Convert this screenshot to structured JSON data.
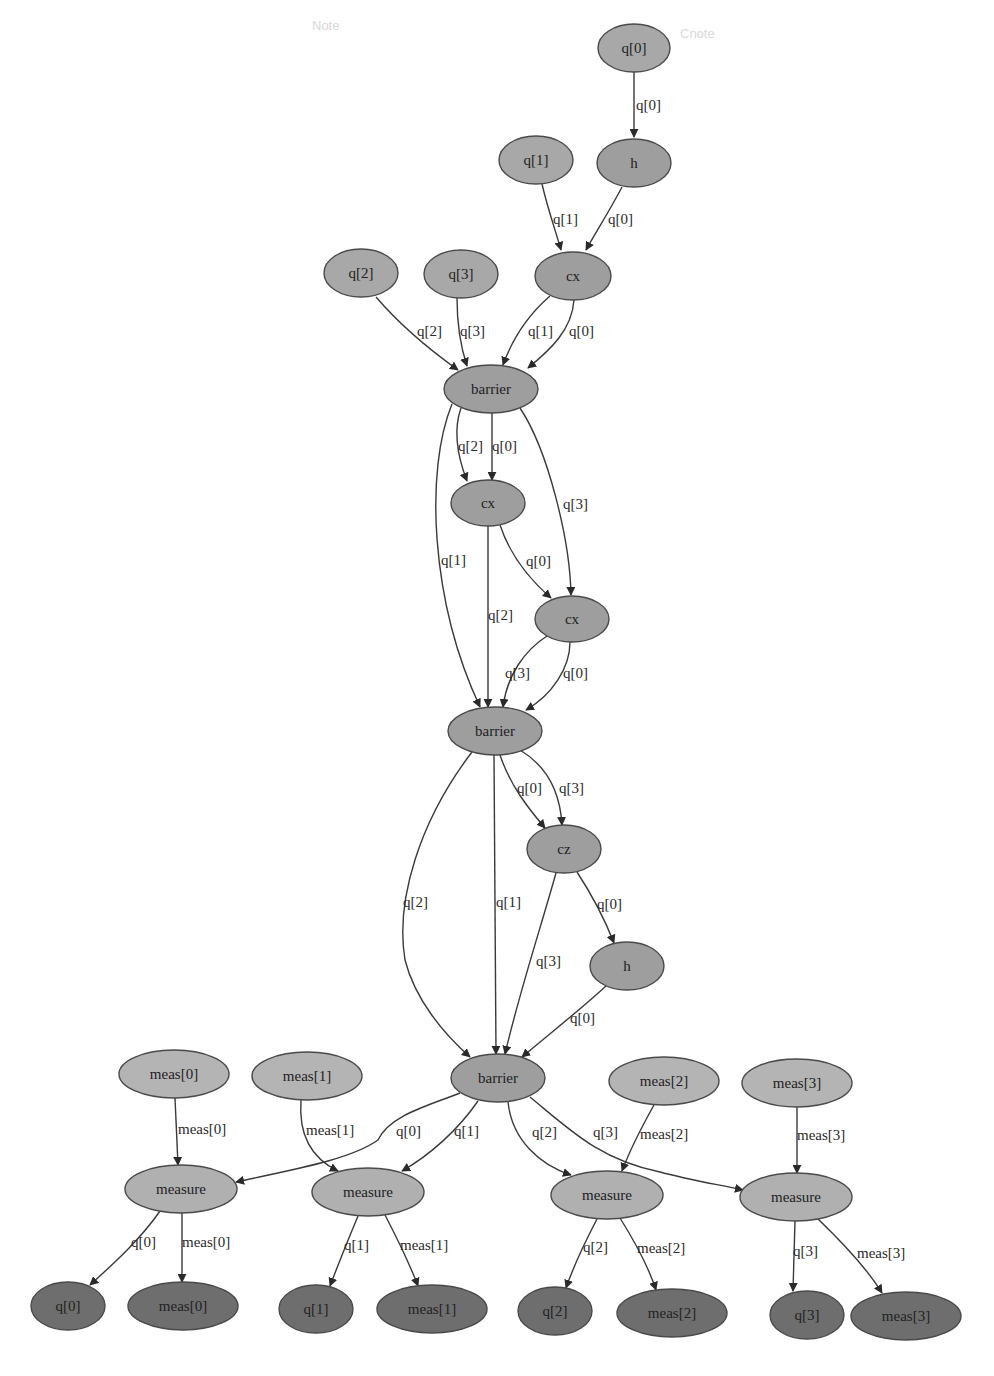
{
  "diagram": {
    "type": "quantum-circuit-dag",
    "watermarks": [
      "Note",
      "Cnote"
    ],
    "nodes": [
      {
        "id": "in_q0",
        "label": "q[0]",
        "kind": "in",
        "x": 634,
        "y": 48,
        "rx": 36,
        "ry": 24
      },
      {
        "id": "h1",
        "label": "h",
        "kind": "op",
        "x": 634,
        "y": 163,
        "rx": 37,
        "ry": 24
      },
      {
        "id": "in_q1",
        "label": "q[1]",
        "kind": "in",
        "x": 536,
        "y": 160,
        "rx": 37,
        "ry": 24
      },
      {
        "id": "cx1",
        "label": "cx",
        "kind": "op",
        "x": 573,
        "y": 276,
        "rx": 38,
        "ry": 24
      },
      {
        "id": "in_q2",
        "label": "q[2]",
        "kind": "in",
        "x": 361,
        "y": 273,
        "rx": 37,
        "ry": 24
      },
      {
        "id": "in_q3",
        "label": "q[3]",
        "kind": "in",
        "x": 461,
        "y": 274,
        "rx": 37,
        "ry": 24
      },
      {
        "id": "barrier1",
        "label": "barrier",
        "kind": "op",
        "x": 491,
        "y": 389,
        "rx": 47,
        "ry": 24
      },
      {
        "id": "cx2",
        "label": "cx",
        "kind": "op",
        "x": 488,
        "y": 503,
        "rx": 37,
        "ry": 23
      },
      {
        "id": "cx3",
        "label": "cx",
        "kind": "op",
        "x": 572,
        "y": 619,
        "rx": 37,
        "ry": 23
      },
      {
        "id": "barrier2",
        "label": "barrier",
        "kind": "op",
        "x": 495,
        "y": 731,
        "rx": 47,
        "ry": 24
      },
      {
        "id": "cz1",
        "label": "cz",
        "kind": "op",
        "x": 564,
        "y": 849,
        "rx": 37,
        "ry": 24
      },
      {
        "id": "h2",
        "label": "h",
        "kind": "op",
        "x": 627,
        "y": 966,
        "rx": 37,
        "ry": 24
      },
      {
        "id": "barrier3",
        "label": "barrier",
        "kind": "op",
        "x": 498,
        "y": 1078,
        "rx": 47,
        "ry": 24
      },
      {
        "id": "in_meas0",
        "label": "meas[0]",
        "kind": "creg",
        "x": 174,
        "y": 1074,
        "rx": 55,
        "ry": 24
      },
      {
        "id": "in_meas1",
        "label": "meas[1]",
        "kind": "creg",
        "x": 307,
        "y": 1076,
        "rx": 55,
        "ry": 24
      },
      {
        "id": "in_meas2",
        "label": "meas[2]",
        "kind": "creg",
        "x": 664,
        "y": 1081,
        "rx": 55,
        "ry": 24
      },
      {
        "id": "in_meas3",
        "label": "meas[3]",
        "kind": "creg",
        "x": 797,
        "y": 1083,
        "rx": 55,
        "ry": 24
      },
      {
        "id": "measure0",
        "label": "measure",
        "kind": "measure",
        "x": 181,
        "y": 1189,
        "rx": 56,
        "ry": 24
      },
      {
        "id": "measure1",
        "label": "measure",
        "kind": "measure",
        "x": 368,
        "y": 1192,
        "rx": 56,
        "ry": 24
      },
      {
        "id": "measure2",
        "label": "measure",
        "kind": "measure",
        "x": 607,
        "y": 1195,
        "rx": 56,
        "ry": 24
      },
      {
        "id": "measure3",
        "label": "measure",
        "kind": "measure",
        "x": 796,
        "y": 1197,
        "rx": 56,
        "ry": 24
      },
      {
        "id": "out_q0",
        "label": "q[0]",
        "kind": "out",
        "x": 68,
        "y": 1306,
        "rx": 37,
        "ry": 24
      },
      {
        "id": "out_meas0",
        "label": "meas[0]",
        "kind": "out",
        "x": 183,
        "y": 1306,
        "rx": 55,
        "ry": 24
      },
      {
        "id": "out_q1",
        "label": "q[1]",
        "kind": "out",
        "x": 316,
        "y": 1309,
        "rx": 37,
        "ry": 24
      },
      {
        "id": "out_meas1",
        "label": "meas[1]",
        "kind": "out",
        "x": 432,
        "y": 1309,
        "rx": 55,
        "ry": 24
      },
      {
        "id": "out_q2",
        "label": "q[2]",
        "kind": "out",
        "x": 555,
        "y": 1311,
        "rx": 37,
        "ry": 24
      },
      {
        "id": "out_meas2",
        "label": "meas[2]",
        "kind": "out",
        "x": 672,
        "y": 1313,
        "rx": 55,
        "ry": 24
      },
      {
        "id": "out_q3",
        "label": "q[3]",
        "kind": "out",
        "x": 807,
        "y": 1315,
        "rx": 37,
        "ry": 24
      },
      {
        "id": "out_meas3",
        "label": "meas[3]",
        "kind": "out",
        "x": 906,
        "y": 1316,
        "rx": 55,
        "ry": 24
      }
    ],
    "edges": [
      {
        "from": "in_q0",
        "to": "h1",
        "label": "q[0]",
        "d": "M634,72 L634,137",
        "lx": 636,
        "ly": 110
      },
      {
        "from": "in_q1",
        "to": "cx1",
        "label": "q[1]",
        "d": "M542,184 C548,210 556,232 561,250",
        "lx": 553,
        "ly": 224
      },
      {
        "from": "h1",
        "to": "cx1",
        "label": "q[0]",
        "d": "M622,187 C610,210 596,232 586,250",
        "lx": 608,
        "ly": 224
      },
      {
        "from": "in_q2",
        "to": "barrier1",
        "label": "q[2]",
        "d": "M376,297 C400,325 430,350 458,370",
        "lx": 417,
        "ly": 336
      },
      {
        "from": "in_q3",
        "to": "barrier1",
        "label": "q[3]",
        "d": "M457,298 C457,320 460,345 467,366",
        "lx": 460,
        "ly": 336
      },
      {
        "from": "cx1",
        "to": "barrier1",
        "label": "q[1]",
        "d": "M550,296 C528,315 512,340 503,365",
        "lx": 528,
        "ly": 336
      },
      {
        "from": "cx1",
        "to": "barrier1",
        "label": "q[0]",
        "d": "M574,300 C572,330 550,350 528,368",
        "lx": 569,
        "ly": 336
      },
      {
        "from": "barrier1",
        "to": "cx2",
        "label": "q[2]",
        "d": "M461,408 C455,425 455,450 467,481",
        "lx": 458,
        "ly": 451
      },
      {
        "from": "barrier1",
        "to": "cx2",
        "label": "q[0]",
        "d": "M492,413 L492,480",
        "lx": 492,
        "ly": 451
      },
      {
        "from": "barrier1",
        "to": "cx3",
        "label": "q[3]",
        "d": "M520,408 C548,450 570,540 571,595",
        "lx": 563,
        "ly": 509
      },
      {
        "from": "barrier1",
        "to": "barrier2",
        "label": "q[1]",
        "d": "M452,404 C425,470 430,600 480,707",
        "lx": 441,
        "ly": 565
      },
      {
        "from": "cx2",
        "to": "barrier2",
        "label": "q[2]",
        "d": "M488,526 L488,707",
        "lx": 488,
        "ly": 620
      },
      {
        "from": "cx2",
        "to": "cx3",
        "label": "q[0]",
        "d": "M500,525 C510,555 528,578 551,598",
        "lx": 526,
        "ly": 566
      },
      {
        "from": "cx3",
        "to": "barrier2",
        "label": "q[3]",
        "d": "M547,636 C525,650 507,675 503,707",
        "lx": 505,
        "ly": 678
      },
      {
        "from": "cx3",
        "to": "barrier2",
        "label": "q[0]",
        "d": "M570,642 C570,668 552,695 526,710",
        "lx": 563,
        "ly": 678
      },
      {
        "from": "barrier2",
        "to": "cz1",
        "label": "q[0]",
        "d": "M500,755 C510,785 528,808 545,828",
        "lx": 517,
        "ly": 793
      },
      {
        "from": "barrier2",
        "to": "cz1",
        "label": "q[3]",
        "d": "M520,750 C545,765 560,790 562,825",
        "lx": 559,
        "ly": 793
      },
      {
        "from": "barrier2",
        "to": "barrier3",
        "label": "q[2]",
        "d": "M472,752 C420,820 395,900 405,960 C415,1000 445,1035 470,1057",
        "lx": 403,
        "ly": 907
      },
      {
        "from": "barrier2",
        "to": "barrier3",
        "label": "q[1]",
        "d": "M494,755 L496,1054",
        "lx": 496,
        "ly": 907
      },
      {
        "from": "cz1",
        "to": "h2",
        "label": "q[0]",
        "d": "M577,872 C592,895 605,920 614,943",
        "lx": 597,
        "ly": 909
      },
      {
        "from": "cz1",
        "to": "barrier3",
        "label": "q[3]",
        "d": "M556,873 C540,930 520,990 505,1054",
        "lx": 536,
        "ly": 966
      },
      {
        "from": "h2",
        "to": "barrier3",
        "label": "q[0]",
        "d": "M606,986 C580,1010 548,1035 522,1057",
        "lx": 570,
        "ly": 1023
      },
      {
        "from": "in_meas0",
        "to": "measure0",
        "label": "meas[0]",
        "d": "M175,1098 L178,1165",
        "lx": 178,
        "ly": 1134
      },
      {
        "from": "in_meas1",
        "to": "measure1",
        "label": "meas[1]",
        "d": "M301,1100 C298,1140 315,1160 338,1171",
        "lx": 306,
        "ly": 1135
      },
      {
        "from": "barrier3",
        "to": "measure0",
        "label": "q[0]",
        "d": "M460,1093 C430,1105 390,1115 378,1140 C350,1160 290,1170 236,1182",
        "lx": 396,
        "ly": 1136
      },
      {
        "from": "barrier3",
        "to": "measure1",
        "label": "q[1]",
        "d": "M478,1101 C458,1130 430,1155 402,1171",
        "lx": 454,
        "ly": 1136
      },
      {
        "from": "barrier3",
        "to": "measure2",
        "label": "q[2]",
        "d": "M508,1102 C512,1140 540,1165 571,1175",
        "lx": 532,
        "ly": 1137
      },
      {
        "from": "barrier3",
        "to": "measure3",
        "label": "q[3]",
        "d": "M530,1097 C570,1130 600,1160 660,1172 C690,1180 715,1184 743,1190",
        "lx": 593,
        "ly": 1137
      },
      {
        "from": "in_meas2",
        "to": "measure2",
        "label": "meas[2]",
        "d": "M654,1105 C640,1130 630,1150 622,1171",
        "lx": 640,
        "ly": 1139
      },
      {
        "from": "in_meas3",
        "to": "measure3",
        "label": "meas[3]",
        "d": "M797,1107 L797,1173",
        "lx": 797,
        "ly": 1140
      },
      {
        "from": "measure0",
        "to": "out_q0",
        "label": "q[0]",
        "d": "M160,1211 C140,1240 112,1265 90,1285",
        "lx": 131,
        "ly": 1247
      },
      {
        "from": "measure0",
        "to": "out_meas0",
        "label": "meas[0]",
        "d": "M182,1213 L182,1282",
        "lx": 182,
        "ly": 1247
      },
      {
        "from": "measure1",
        "to": "out_q1",
        "label": "q[1]",
        "d": "M358,1216 C348,1240 338,1265 330,1286",
        "lx": 344,
        "ly": 1250
      },
      {
        "from": "measure1",
        "to": "out_meas1",
        "label": "meas[1]",
        "d": "M385,1215 C398,1240 410,1265 418,1286",
        "lx": 400,
        "ly": 1250
      },
      {
        "from": "measure2",
        "to": "out_q2",
        "label": "q[2]",
        "d": "M597,1219 C585,1242 574,1265 566,1288",
        "lx": 583,
        "ly": 1252
      },
      {
        "from": "measure2",
        "to": "out_meas2",
        "label": "meas[2]",
        "d": "M620,1218 C635,1242 648,1265 656,1290",
        "lx": 637,
        "ly": 1253
      },
      {
        "from": "measure3",
        "to": "out_q3",
        "label": "q[3]",
        "d": "M795,1221 L793,1291",
        "lx": 793,
        "ly": 1256
      },
      {
        "from": "measure3",
        "to": "out_meas3",
        "label": "meas[3]",
        "d": "M818,1219 C845,1245 868,1270 882,1293",
        "lx": 857,
        "ly": 1258
      }
    ]
  }
}
